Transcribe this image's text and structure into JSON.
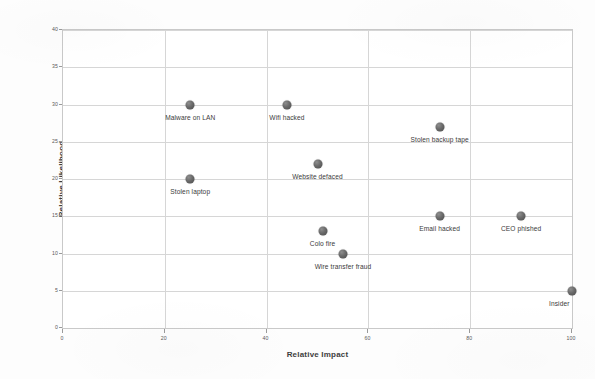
{
  "chart_data": {
    "type": "scatter",
    "title": "",
    "xlabel": "Relative Impact",
    "ylabel": "Relative Likelihood",
    "xlim": [
      0,
      100
    ],
    "ylim": [
      0,
      40
    ],
    "xticks": [
      0,
      20,
      40,
      60,
      80,
      100
    ],
    "yticks": [
      0,
      5,
      10,
      15,
      20,
      25,
      30,
      35,
      40
    ],
    "grid": true,
    "legend": "none",
    "marker_color": "#5f5f5f",
    "points": [
      {
        "label": "Malware on LAN",
        "x": 25,
        "y": 30,
        "label_pos": "below"
      },
      {
        "label": "Wifi hacked",
        "x": 44,
        "y": 30,
        "label_pos": "below"
      },
      {
        "label": "Stolen backup tape",
        "x": 74,
        "y": 27,
        "label_pos": "below"
      },
      {
        "label": "Website defaced",
        "x": 50,
        "y": 22,
        "label_pos": "below"
      },
      {
        "label": "Stolen laptop",
        "x": 25,
        "y": 20,
        "label_pos": "below"
      },
      {
        "label": "Email hacked",
        "x": 74,
        "y": 15,
        "label_pos": "below"
      },
      {
        "label": "CEO phished",
        "x": 90,
        "y": 15,
        "label_pos": "below"
      },
      {
        "label": "Colo fire",
        "x": 51,
        "y": 13,
        "label_pos": "below"
      },
      {
        "label": "Wire transfer fraud",
        "x": 55,
        "y": 10,
        "label_pos": "below"
      },
      {
        "label": "Insider",
        "x": 100,
        "y": 5,
        "label_pos": "below"
      }
    ]
  }
}
